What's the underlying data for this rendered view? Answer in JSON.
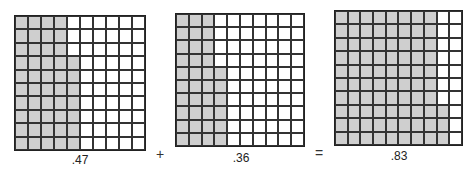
{
  "grids": [
    {
      "label": ".47",
      "value": 47,
      "full_columns": 4,
      "partial_column_cells": 7
    },
    {
      "label": ".36",
      "value": 36,
      "full_columns": 3,
      "partial_column_cells": 6
    },
    {
      "label": ".83",
      "value": 83,
      "full_columns": 8,
      "partial_column_cells": 3
    }
  ],
  "operators": {
    "plus": "+",
    "equals": "="
  },
  "colors": {
    "shaded": "#cfcfcf",
    "unshaded": "#ffffff",
    "lines": "#222222"
  }
}
